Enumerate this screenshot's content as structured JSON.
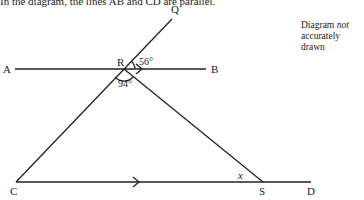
{
  "caption": "In the diagram, the lines AB and CD are parallel.",
  "note": {
    "line1": "Diagram",
    "italic": "not",
    "line2": "accurately drawn"
  },
  "points": {
    "A": "A",
    "B": "B",
    "C": "C",
    "D": "D",
    "Q": "Q",
    "R": "R",
    "S": "S"
  },
  "angles": {
    "QRB": "56°",
    "CRS": "94°",
    "RSC": "x"
  },
  "colors": {
    "ink": "#222222"
  }
}
